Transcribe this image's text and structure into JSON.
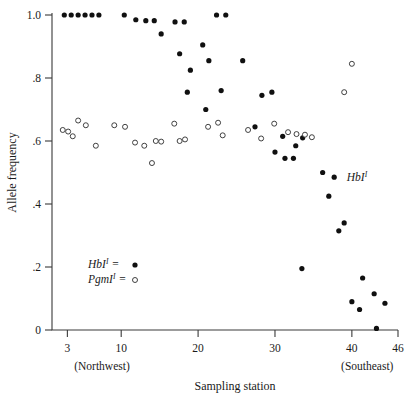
{
  "chart_data": {
    "type": "scatter",
    "title": "",
    "xlabel": "Sampling station",
    "ylabel": "Allele frequency",
    "xlim": [
      1,
      46
    ],
    "ylim": [
      0,
      1.0
    ],
    "grid": false,
    "legend_position": "lower-left-inside",
    "xticks": [
      3,
      10,
      20,
      30,
      40,
      46
    ],
    "xtick_labels": [
      "3",
      "10",
      "20",
      "30",
      "40",
      "46"
    ],
    "yticks": [
      0,
      0.2,
      0.4,
      0.6,
      0.8,
      1.0
    ],
    "ytick_labels": [
      "0",
      ".2",
      ".4",
      ".6",
      ".8",
      "1.0"
    ],
    "x_end_labels": {
      "left": "(Northwest)",
      "right": "(Southeast)"
    },
    "annotations": [
      {
        "text": "HbI",
        "superscript": "I",
        "x": 38.3,
        "y": 0.485
      }
    ],
    "series": [
      {
        "name": "HbI",
        "superscript": "I",
        "marker": "filled-circle",
        "color": "#101010",
        "legend_label": "HbI",
        "legend_equals": "=",
        "points": [
          {
            "x": 2.6,
            "y": 1.0
          },
          {
            "x": 3.5,
            "y": 1.0
          },
          {
            "x": 4.4,
            "y": 1.0
          },
          {
            "x": 5.3,
            "y": 1.0
          },
          {
            "x": 6.2,
            "y": 1.0
          },
          {
            "x": 7.1,
            "y": 1.0
          },
          {
            "x": 10.4,
            "y": 1.0
          },
          {
            "x": 11.9,
            "y": 0.985
          },
          {
            "x": 13.2,
            "y": 0.982
          },
          {
            "x": 14.3,
            "y": 0.982
          },
          {
            "x": 15.2,
            "y": 0.94
          },
          {
            "x": 17.0,
            "y": 0.978
          },
          {
            "x": 18.2,
            "y": 0.978
          },
          {
            "x": 17.6,
            "y": 0.877
          },
          {
            "x": 19.0,
            "y": 0.825
          },
          {
            "x": 18.6,
            "y": 0.755
          },
          {
            "x": 20.6,
            "y": 0.905
          },
          {
            "x": 21.4,
            "y": 0.855
          },
          {
            "x": 22.4,
            "y": 1.0
          },
          {
            "x": 23.6,
            "y": 1.0
          },
          {
            "x": 21.0,
            "y": 0.7
          },
          {
            "x": 23.0,
            "y": 0.76
          },
          {
            "x": 25.8,
            "y": 0.855
          },
          {
            "x": 28.3,
            "y": 0.745
          },
          {
            "x": 29.6,
            "y": 0.755
          },
          {
            "x": 27.4,
            "y": 0.645
          },
          {
            "x": 31.0,
            "y": 0.615
          },
          {
            "x": 30.0,
            "y": 0.565
          },
          {
            "x": 31.3,
            "y": 0.545
          },
          {
            "x": 32.4,
            "y": 0.545
          },
          {
            "x": 32.7,
            "y": 0.585
          },
          {
            "x": 33.6,
            "y": 0.61
          },
          {
            "x": 36.2,
            "y": 0.5
          },
          {
            "x": 37.7,
            "y": 0.485
          },
          {
            "x": 37.0,
            "y": 0.425
          },
          {
            "x": 38.3,
            "y": 0.315
          },
          {
            "x": 39.0,
            "y": 0.34
          },
          {
            "x": 33.5,
            "y": 0.195
          },
          {
            "x": 41.4,
            "y": 0.165
          },
          {
            "x": 42.9,
            "y": 0.115
          },
          {
            "x": 40.0,
            "y": 0.09
          },
          {
            "x": 41.0,
            "y": 0.065
          },
          {
            "x": 44.3,
            "y": 0.085
          },
          {
            "x": 43.2,
            "y": 0.005
          }
        ]
      },
      {
        "name": "PgmI",
        "superscript": "I",
        "marker": "open-circle",
        "color": "#2c2c2c",
        "legend_label": "PgmI",
        "legend_equals": "=",
        "points": [
          {
            "x": 2.4,
            "y": 0.635
          },
          {
            "x": 3.1,
            "y": 0.63
          },
          {
            "x": 3.7,
            "y": 0.615
          },
          {
            "x": 4.4,
            "y": 0.665
          },
          {
            "x": 5.4,
            "y": 0.65
          },
          {
            "x": 6.7,
            "y": 0.585
          },
          {
            "x": 9.1,
            "y": 0.65
          },
          {
            "x": 10.5,
            "y": 0.645
          },
          {
            "x": 11.8,
            "y": 0.595
          },
          {
            "x": 13.0,
            "y": 0.585
          },
          {
            "x": 14.5,
            "y": 0.6
          },
          {
            "x": 15.2,
            "y": 0.598
          },
          {
            "x": 14.0,
            "y": 0.53
          },
          {
            "x": 16.9,
            "y": 0.655
          },
          {
            "x": 17.6,
            "y": 0.6
          },
          {
            "x": 18.3,
            "y": 0.605
          },
          {
            "x": 21.3,
            "y": 0.645
          },
          {
            "x": 22.6,
            "y": 0.658
          },
          {
            "x": 23.2,
            "y": 0.618
          },
          {
            "x": 26.5,
            "y": 0.635
          },
          {
            "x": 28.2,
            "y": 0.608
          },
          {
            "x": 29.9,
            "y": 0.655
          },
          {
            "x": 31.7,
            "y": 0.628
          },
          {
            "x": 32.8,
            "y": 0.622
          },
          {
            "x": 33.9,
            "y": 0.62
          },
          {
            "x": 34.8,
            "y": 0.612
          },
          {
            "x": 39.0,
            "y": 0.755
          },
          {
            "x": 40.0,
            "y": 0.845
          }
        ]
      }
    ]
  }
}
